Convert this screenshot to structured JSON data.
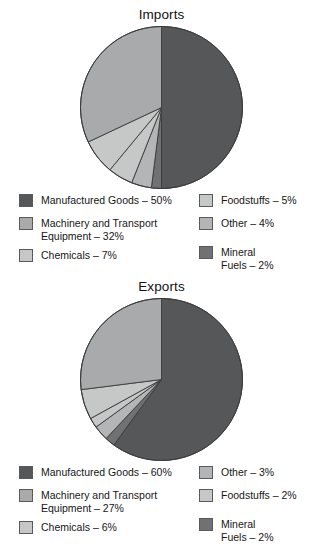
{
  "palette": {
    "manufactured_goods": "#555759",
    "machinery_transport": "#a9aaab",
    "chemicals": "#c6c7c7",
    "foodstuffs": "#c6c7c7",
    "other": "#b4b5b6",
    "mineral_fuels": "#6f7172",
    "outline": "#3a3a3a",
    "background": "#ffffff",
    "text": "#161616"
  },
  "charts": [
    {
      "id": "imports",
      "title": "Imports",
      "legend": {
        "left_column": [
          {
            "label": "Manufactured Goods – 50%",
            "color_key": "manufactured_goods",
            "name": "manufactured-goods"
          },
          {
            "label": "Machinery and Transport\nEquipment – 32%",
            "color_key": "machinery_transport",
            "name": "machinery-and-transport-equipment"
          },
          {
            "label": "Chemicals – 7%",
            "color_key": "chemicals",
            "name": "chemicals"
          }
        ],
        "right_column": [
          {
            "label": "Foodstuffs – 5%",
            "color_key": "foodstuffs",
            "name": "foodstuffs"
          },
          {
            "label": "Other – 4%",
            "color_key": "other",
            "name": "other"
          },
          {
            "label": "Mineral\nFuels – 2%",
            "color_key": "mineral_fuels",
            "name": "mineral-fuels"
          }
        ]
      }
    },
    {
      "id": "exports",
      "title": "Exports",
      "legend": {
        "left_column": [
          {
            "label": "Manufactured Goods – 60%",
            "color_key": "manufactured_goods",
            "name": "manufactured-goods"
          },
          {
            "label": "Machinery and Transport\nEquipment – 27%",
            "color_key": "machinery_transport",
            "name": "machinery-and-transport-equipment"
          },
          {
            "label": "Chemicals – 6%",
            "color_key": "chemicals",
            "name": "chemicals"
          }
        ],
        "right_column": [
          {
            "label": "Other – 3%",
            "color_key": "other",
            "name": "other"
          },
          {
            "label": "Foodstuffs – 2%",
            "color_key": "foodstuffs",
            "name": "foodstuffs"
          },
          {
            "label": "Mineral\nFuels – 2%",
            "color_key": "mineral_fuels",
            "name": "mineral-fuels"
          }
        ]
      }
    }
  ],
  "chart_data": [
    {
      "type": "pie",
      "id": "imports",
      "title": "Imports",
      "unit": "percent",
      "start_angle_deg": 0,
      "direction": "clockwise",
      "labels": [
        "Manufactured Goods",
        "Mineral Fuels",
        "Other",
        "Foodstuffs",
        "Chemicals",
        "Machinery and Transport Equipment"
      ],
      "values": [
        50,
        2,
        4,
        5,
        7,
        32
      ],
      "colors": [
        "#555759",
        "#6f7172",
        "#b4b5b6",
        "#c6c7c7",
        "#c6c7c7",
        "#a9aaab"
      ],
      "legend_position": "bottom",
      "legend_entries": [
        "Manufactured Goods – 50%",
        "Machinery and Transport Equipment – 32%",
        "Chemicals – 7%",
        "Foodstuffs – 5%",
        "Other – 4%",
        "Mineral Fuels – 2%"
      ]
    },
    {
      "type": "pie",
      "id": "exports",
      "title": "Exports",
      "unit": "percent",
      "start_angle_deg": 0,
      "direction": "clockwise",
      "labels": [
        "Manufactured Goods",
        "Mineral Fuels",
        "Other",
        "Foodstuffs",
        "Chemicals",
        "Machinery and Transport Equipment"
      ],
      "values": [
        60,
        2,
        3,
        2,
        6,
        27
      ],
      "colors": [
        "#555759",
        "#6f7172",
        "#b4b5b6",
        "#c6c7c7",
        "#c6c7c7",
        "#a9aaab"
      ],
      "legend_position": "bottom",
      "legend_entries": [
        "Manufactured Goods – 60%",
        "Machinery and Transport Equipment – 27%",
        "Chemicals – 6%",
        "Other – 3%",
        "Foodstuffs – 2%",
        "Mineral Fuels – 2%"
      ]
    }
  ]
}
